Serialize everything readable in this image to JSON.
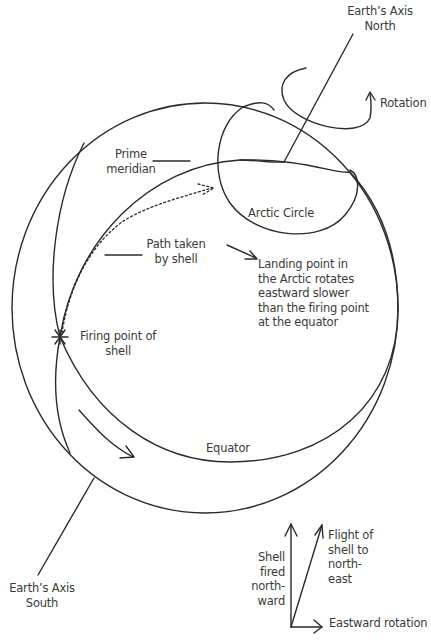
{
  "diagram": {
    "labels": {
      "axis_north": "Earth’s Axis\nNorth",
      "rotation": "Rotation",
      "prime_meridian": "Prime\nmeridian",
      "arctic_circle": "Arctic Circle",
      "path_taken": "Path taken\nby shell",
      "landing_point": "Landing point in\nthe Arctic rotates\neastward slower\nthan the firing point\nat the equator",
      "firing_point": "Firing point of\nshell",
      "equator": "Equator",
      "axis_south": "Earth’s Axis\nSouth",
      "shell_fired": "Shell\nfired\nnorth-\nward",
      "flight_of_shell": "Flight of\nshell to\nnorth-\neast",
      "eastward_rotation": "Eastward rotation"
    },
    "vector_diagram": {
      "components": [
        "Shell fired northward",
        "Eastward rotation"
      ],
      "resultant": "Flight of shell to north-east"
    },
    "colors": {
      "line": "#2b2b2b",
      "text": "#3a3a3a",
      "background": "#ffffff"
    }
  }
}
